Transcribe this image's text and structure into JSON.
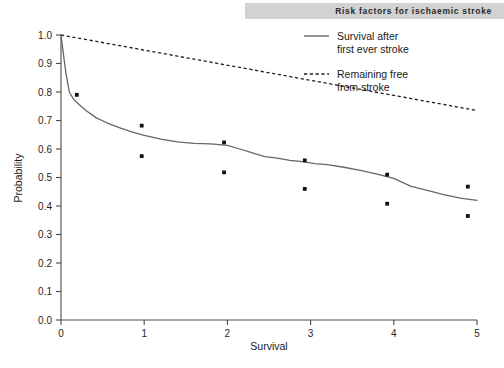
{
  "header": {
    "title": "Risk factors for ischaemic stroke",
    "banner_color": "#d2d2d2"
  },
  "chart_data": {
    "type": "line",
    "title": "",
    "xlabel": "Survival",
    "ylabel": "Probability",
    "xlim": [
      0,
      5
    ],
    "ylim": [
      0.0,
      1.0
    ],
    "grid": false,
    "legend_position": "top-right",
    "x_ticks": [
      "0",
      "1",
      "2",
      "3",
      "4",
      "5"
    ],
    "x_tick_values": [
      0,
      1,
      2,
      3,
      4,
      5
    ],
    "y_ticks": [
      "0.0",
      "0.1",
      "0.2",
      "0.3",
      "0.4",
      "0.5",
      "0.6",
      "0.7",
      "0.8",
      "0.9",
      "1.0"
    ],
    "y_tick_values": [
      0.0,
      0.1,
      0.2,
      0.3,
      0.4,
      0.5,
      0.6,
      0.7,
      0.8,
      0.9,
      1.0
    ],
    "series": [
      {
        "name": "Survival after first ever stroke",
        "style": "solid",
        "color": "#666666",
        "x": [
          0.0,
          0.03,
          0.06,
          0.1,
          0.15,
          0.22,
          0.3,
          0.42,
          0.55,
          0.7,
          0.85,
          1.0,
          1.2,
          1.4,
          1.6,
          1.8,
          2.0,
          2.15,
          2.3,
          2.45,
          2.6,
          2.75,
          2.9,
          3.05,
          3.2,
          3.4,
          3.6,
          3.8,
          4.0,
          4.2,
          4.4,
          4.6,
          4.8,
          5.0
        ],
        "y": [
          1.0,
          0.93,
          0.865,
          0.8,
          0.775,
          0.755,
          0.735,
          0.71,
          0.692,
          0.675,
          0.66,
          0.648,
          0.635,
          0.625,
          0.62,
          0.618,
          0.613,
          0.6,
          0.586,
          0.573,
          0.568,
          0.56,
          0.556,
          0.549,
          0.545,
          0.536,
          0.525,
          0.512,
          0.497,
          0.47,
          0.455,
          0.44,
          0.428,
          0.42
        ]
      },
      {
        "name": "Remaining free from stroke",
        "style": "dashed",
        "color": "#1f1f1f",
        "x": [
          0,
          5
        ],
        "y": [
          1.0,
          0.735
        ]
      }
    ],
    "scatter": {
      "name": "observed points",
      "color": "#111111",
      "points": [
        {
          "x": 0.19,
          "y": 0.79
        },
        {
          "x": 0.97,
          "y": 0.682
        },
        {
          "x": 0.97,
          "y": 0.575
        },
        {
          "x": 1.96,
          "y": 0.623
        },
        {
          "x": 1.96,
          "y": 0.518
        },
        {
          "x": 2.93,
          "y": 0.56
        },
        {
          "x": 2.93,
          "y": 0.46
        },
        {
          "x": 3.92,
          "y": 0.51
        },
        {
          "x": 3.92,
          "y": 0.408
        },
        {
          "x": 4.89,
          "y": 0.468
        },
        {
          "x": 4.89,
          "y": 0.365
        }
      ]
    },
    "legend": [
      {
        "label_line1": "Survival after",
        "label_line2": "first ever stroke",
        "style": "solid"
      },
      {
        "label_line1": "Remaining free",
        "label_line2": "from stroke",
        "style": "dashed"
      }
    ]
  }
}
